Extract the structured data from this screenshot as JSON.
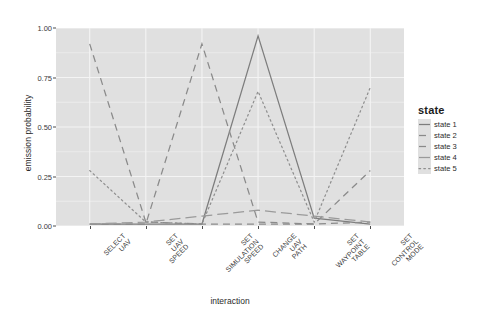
{
  "chart_data": {
    "type": "line",
    "title": "",
    "xlabel": "interaction",
    "ylabel": "emission probability",
    "categories": [
      "SELECT UAV",
      "SET UAV SPEED",
      "SET SIMULATION SPEED",
      "CHANGE UAV PATH",
      "SET WAYPOINT TABLE",
      "SET CONTROL MODE"
    ],
    "ylim": [
      0.0,
      1.0
    ],
    "yticks": [
      0.0,
      0.25,
      0.5,
      0.75,
      1.0
    ],
    "ytick_labels": [
      "0.00",
      "0.25",
      "0.50",
      "0.75",
      "1.00"
    ],
    "grid": true,
    "legend_position": "right",
    "legend_title": "state",
    "series": [
      {
        "name": "state 1",
        "linetype": "solid",
        "color": "#7d7d7d",
        "values": [
          0.01,
          0.01,
          0.01,
          0.96,
          0.04,
          0.01
        ]
      },
      {
        "name": "state 2",
        "linetype": "dashed",
        "color": "#8a8a8a",
        "values": [
          0.92,
          0.02,
          0.01,
          0.01,
          0.01,
          0.02
        ]
      },
      {
        "name": "state 3",
        "linetype": "dashed",
        "color": "#8a8a8a",
        "values": [
          0.01,
          0.01,
          0.92,
          0.02,
          0.01,
          0.28
        ]
      },
      {
        "name": "state 4",
        "linetype": "longdash",
        "color": "#9a9a9a",
        "values": [
          0.01,
          0.02,
          0.05,
          0.08,
          0.05,
          0.02
        ]
      },
      {
        "name": "state 5",
        "linetype": "dotted",
        "color": "#8f8f8f",
        "values": [
          0.28,
          0.02,
          0.01,
          0.68,
          0.02,
          0.7
        ]
      }
    ]
  },
  "panel": {
    "background": "#e0e0e0",
    "gridline_color": "#f4f4f4",
    "axis_color": "#4d4d4d"
  }
}
